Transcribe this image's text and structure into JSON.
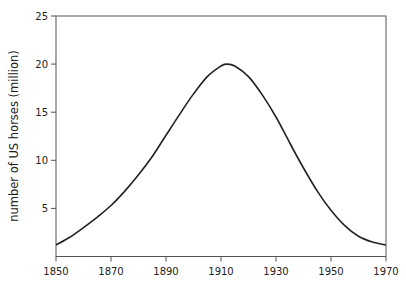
{
  "chart_data": {
    "type": "line",
    "title": "",
    "xlabel": "",
    "ylabel": "number of US horses (million)",
    "xlim": [
      1850,
      1970
    ],
    "ylim": [
      0,
      25
    ],
    "xticks": [
      1850,
      1870,
      1890,
      1910,
      1930,
      1950,
      1970
    ],
    "yticks": [
      5,
      10,
      15,
      20,
      25
    ],
    "grid": false,
    "legend": null,
    "series": [
      {
        "name": "US horses",
        "color": "#222222",
        "x": [
          1850,
          1855,
          1860,
          1865,
          1870,
          1875,
          1880,
          1885,
          1890,
          1895,
          1900,
          1905,
          1910,
          1912,
          1915,
          1920,
          1925,
          1930,
          1935,
          1940,
          1945,
          1950,
          1955,
          1960,
          1965,
          1970
        ],
        "y": [
          1.2,
          2.0,
          3.0,
          4.1,
          5.3,
          6.8,
          8.5,
          10.4,
          12.6,
          14.8,
          16.9,
          18.7,
          19.8,
          20.0,
          19.8,
          18.7,
          16.8,
          14.5,
          11.8,
          9.2,
          6.8,
          4.8,
          3.2,
          2.1,
          1.5,
          1.2
        ]
      }
    ]
  }
}
